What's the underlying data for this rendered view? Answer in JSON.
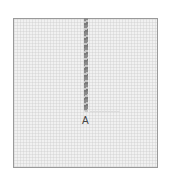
{
  "diagram": {
    "type": "embroidery-stitch-step",
    "fabric": {
      "color": "#f1f1f1",
      "border_color": "#9a9a9a"
    },
    "thread": {
      "color": "#8a8a8a",
      "direction": "vertical",
      "ends_at": "A"
    },
    "points": [
      {
        "label": "A"
      }
    ]
  }
}
